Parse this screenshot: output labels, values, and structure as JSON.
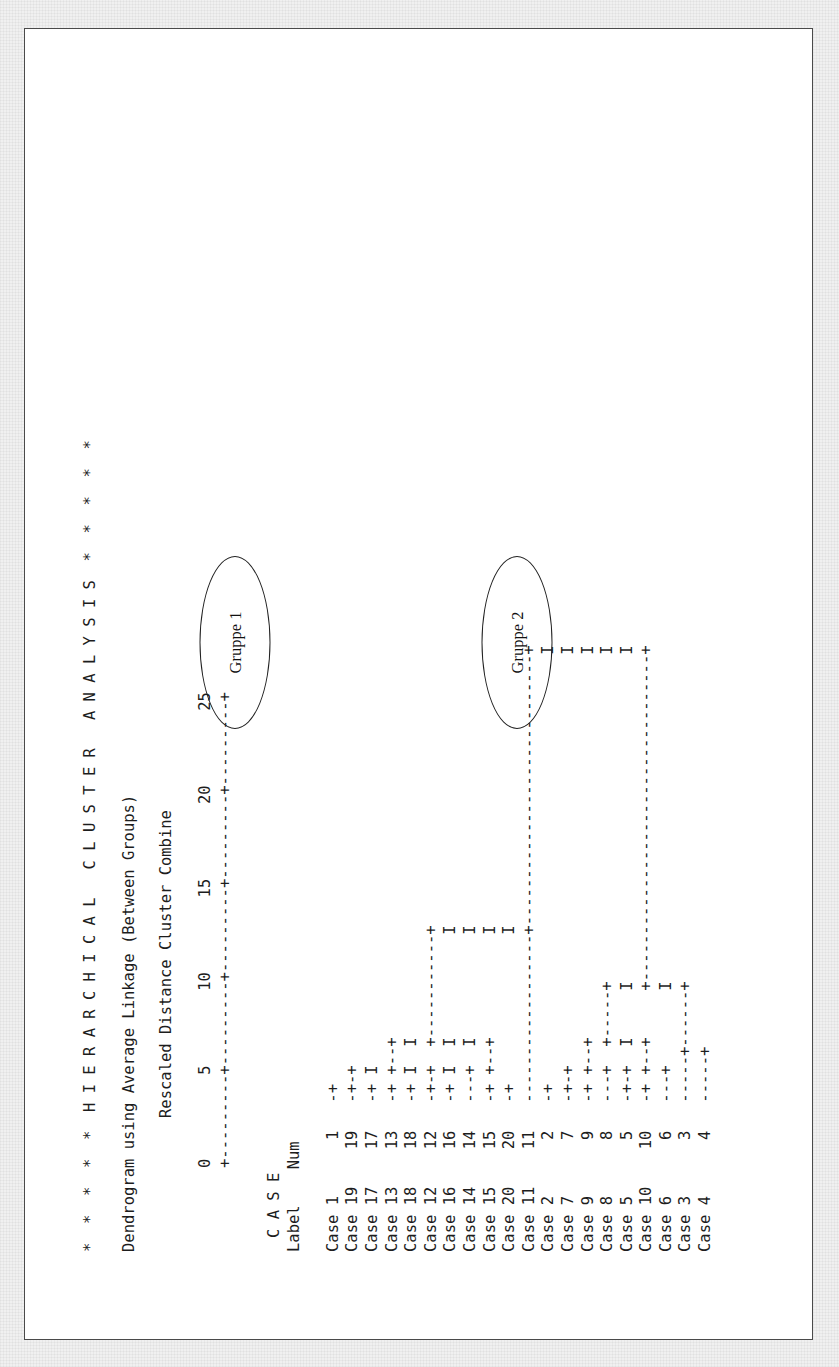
{
  "report": {
    "banner": "*  *  *  *  *  H I E R A R C H I C A L   C L U S T E R   A N A L Y S I S  *  *  *  *  *",
    "method_line": "Dendrogram using Average Linkage (Between Groups)",
    "axis_title": "Rescaled Distance Cluster Combine",
    "header_case": "C A S E",
    "header_label": "Label",
    "header_num": "Num"
  },
  "annotations": [
    {
      "id": "gruppe-1",
      "label": "Gruppe 1"
    },
    {
      "id": "gruppe-2",
      "label": "Gruppe 2"
    }
  ],
  "chart_data": {
    "type": "dendrogram",
    "title": "Dendrogram using Average Linkage (Between Groups)",
    "xlabel": "Rescaled Distance Cluster Combine",
    "ylabel": "CASE",
    "xlim": [
      0,
      25
    ],
    "xticks": [
      0,
      5,
      10,
      15,
      20,
      25
    ],
    "grid": false,
    "legend": "none",
    "orientation": "horizontal-ascii",
    "leaf_order": [
      1,
      19,
      17,
      13,
      18,
      12,
      16,
      14,
      15,
      20,
      11,
      2,
      7,
      9,
      8,
      5,
      10,
      6,
      3,
      4
    ],
    "leaf_labels": [
      "Case 1",
      "Case 19",
      "Case 17",
      "Case 13",
      "Case 18",
      "Case 12",
      "Case 16",
      "Case 14",
      "Case 15",
      "Case 20",
      "Case 11",
      "Case 2",
      "Case 7",
      "Case 9",
      "Case 8",
      "Case 5",
      "Case 10",
      "Case 6",
      "Case 3",
      "Case 4"
    ],
    "leaf_nums": [
      1,
      19,
      17,
      13,
      18,
      12,
      16,
      14,
      15,
      20,
      11,
      2,
      7,
      9,
      8,
      5,
      10,
      6,
      3,
      4
    ],
    "merges": [
      {
        "members": [
          19,
          17
        ],
        "distance": 1.5
      },
      {
        "members": [
          1,
          19,
          17
        ],
        "distance": 2.0
      },
      {
        "members": [
          13,
          18
        ],
        "distance": 3.5
      },
      {
        "members": [
          12,
          16
        ],
        "distance": 2.0
      },
      {
        "members": [
          13,
          18,
          12,
          16
        ],
        "distance": 4.0
      },
      {
        "members": [
          14,
          15
        ],
        "distance": 2.0
      },
      {
        "members": [
          14,
          15,
          20
        ],
        "distance": 4.0
      },
      {
        "members": [
          1,
          19,
          17,
          13,
          18,
          12,
          16,
          14,
          15,
          20
        ],
        "distance": 11.5
      },
      {
        "members": [
          7,
          9
        ],
        "distance": 2.0
      },
      {
        "members": [
          7,
          9,
          8
        ],
        "distance": 3.0
      },
      {
        "members": [
          5,
          10
        ],
        "distance": 3.0
      },
      {
        "members": [
          5,
          10,
          8,
          7,
          9
        ],
        "distance": 7.5
      },
      {
        "members": [
          3,
          4
        ],
        "distance": 2.5
      },
      {
        "members": [
          6,
          3,
          4
        ],
        "distance": 3.0
      },
      {
        "members": [
          2,
          7,
          9,
          8,
          5,
          10,
          6,
          3,
          4
        ],
        "distance": 11.5
      },
      {
        "members": [
          11,
          "cluster-1"
        ],
        "distance": 11.5
      },
      {
        "members": [
          "all"
        ],
        "distance": 25.0
      }
    ],
    "ascii_axis_ticks": "         0         5        10        15        20        25",
    "ascii_axis_rule": "         +---------+---------+---------+---------+---------+",
    "ascii_rows": [
      {
        "label": "Case 1",
        "num": "1",
        "art": "   -+"
      },
      {
        "label": "Case 19",
        "num": "19",
        "art": "   -+-+"
      },
      {
        "label": "Case 17",
        "num": "17",
        "art": "   -+ I"
      },
      {
        "label": "Case 13",
        "num": "13",
        "art": "   -+ +--+"
      },
      {
        "label": "Case 18",
        "num": "18",
        "art": "   -+ I  I"
      },
      {
        "label": "Case 12",
        "num": "12",
        "art": "   -+-+  +-----------+"
      },
      {
        "label": "Case 16",
        "num": "16",
        "art": "   -+ I  I           I"
      },
      {
        "label": "Case 14",
        "num": "14",
        "art": "   ---+  I           I"
      },
      {
        "label": "Case 15",
        "num": "15",
        "art": "   -+ +--+           I"
      },
      {
        "label": "Case 20",
        "num": "20",
        "art": "   -+                I"
      },
      {
        "label": "Case 11",
        "num": "11",
        "art": "   ------------------+-----------------------------+"
      },
      {
        "label": "Case 2",
        "num": "2",
        "art": "   -+                                              I"
      },
      {
        "label": "Case 7",
        "num": "7",
        "art": "   -+-+                                            I"
      },
      {
        "label": "Case 9",
        "num": "9",
        "art": "   -+ +--+                                         I"
      },
      {
        "label": "Case 8",
        "num": "8",
        "art": "   ---+  +-----+                                   I"
      },
      {
        "label": "Case 5",
        "num": "5",
        "art": "   -+-+  I     I                                   I"
      },
      {
        "label": "Case 10",
        "num": "10",
        "art": "   -+ +--+     +-----------------------------------+"
      },
      {
        "label": "Case 6",
        "num": "6",
        "art": "   ---+        I"
      },
      {
        "label": "Case 3",
        "num": "3",
        "art": "   -----+------+"
      },
      {
        "label": "Case 4",
        "num": "4",
        "art": "   -----+"
      }
    ]
  }
}
